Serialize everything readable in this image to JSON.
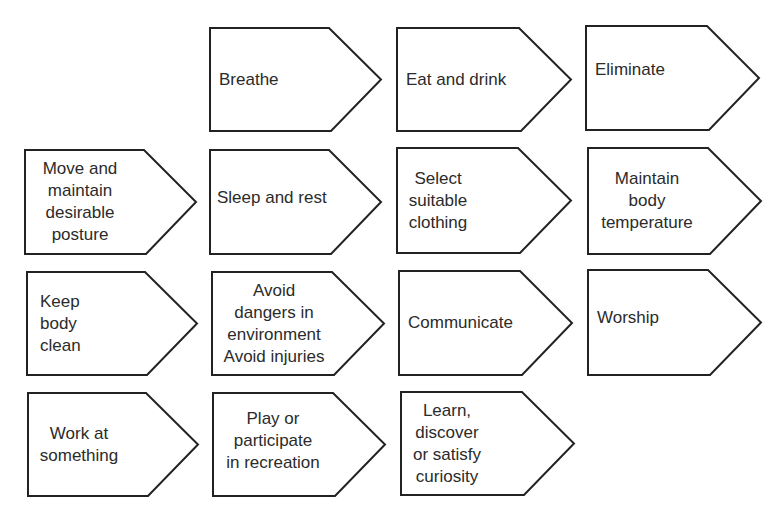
{
  "diagram": {
    "type": "pentagon-arrow-grid",
    "stroke_color": "#222222",
    "fill_color": "#ffffff",
    "nodes": [
      {
        "id": "breathe",
        "lines": [
          "Breathe"
        ],
        "row": 1,
        "col": 2,
        "x": 209,
        "y": 27,
        "w": 173,
        "h": 105,
        "align": "left",
        "label_left": 10,
        "label_width": 110
      },
      {
        "id": "eat-and-drink",
        "lines": [
          "Eat and drink"
        ],
        "row": 1,
        "col": 3,
        "x": 396,
        "y": 27,
        "w": 176,
        "h": 105,
        "align": "left",
        "label_left": 10,
        "label_width": 120
      },
      {
        "id": "eliminate",
        "lines": [
          "Eliminate"
        ],
        "row": 1,
        "col": 4,
        "x": 585,
        "y": 25,
        "w": 175,
        "h": 106,
        "align": "left",
        "label_left": 10,
        "label_width": 110,
        "label_offset_y": -8
      },
      {
        "id": "move-and-maintain-desirable-posture",
        "lines": [
          "Move and",
          "maintain",
          "desirable",
          "posture"
        ],
        "row": 2,
        "col": 1,
        "x": 24,
        "y": 149,
        "w": 173,
        "h": 106,
        "align": "center",
        "label_left": 6,
        "label_width": 100
      },
      {
        "id": "sleep-and-rest",
        "lines": [
          "Sleep and rest"
        ],
        "row": 2,
        "col": 2,
        "x": 209,
        "y": 149,
        "w": 173,
        "h": 106,
        "align": "left",
        "label_left": 8,
        "label_width": 130,
        "label_offset_y": -4
      },
      {
        "id": "select-suitable-clothing",
        "lines": [
          "Select",
          "suitable",
          "clothing"
        ],
        "row": 2,
        "col": 3,
        "x": 396,
        "y": 147,
        "w": 176,
        "h": 107,
        "align": "center",
        "label_left": 8,
        "label_width": 68
      },
      {
        "id": "maintain-body-temperature",
        "lines": [
          "Maintain",
          "body",
          "temperature"
        ],
        "row": 2,
        "col": 4,
        "x": 587,
        "y": 147,
        "w": 175,
        "h": 108,
        "align": "center",
        "label_left": 10,
        "label_width": 100
      },
      {
        "id": "keep-body-clean",
        "lines": [
          "Keep",
          "body",
          "clean"
        ],
        "row": 3,
        "col": 1,
        "x": 26,
        "y": 271,
        "w": 172,
        "h": 105,
        "align": "left",
        "label_left": 14,
        "label_width": 60
      },
      {
        "id": "avoid-dangers-avoid-injuries",
        "lines": [
          "Avoid",
          "dangers in",
          "environment",
          "Avoid injuries"
        ],
        "row": 3,
        "col": 2,
        "x": 211,
        "y": 271,
        "w": 174,
        "h": 105,
        "align": "center",
        "label_left": 4,
        "label_width": 118
      },
      {
        "id": "communicate",
        "lines": [
          "Communicate"
        ],
        "row": 3,
        "col": 3,
        "x": 398,
        "y": 270,
        "w": 175,
        "h": 106,
        "align": "left",
        "label_left": 10,
        "label_width": 120
      },
      {
        "id": "worship",
        "lines": [
          "Worship"
        ],
        "row": 3,
        "col": 4,
        "x": 587,
        "y": 269,
        "w": 175,
        "h": 107,
        "align": "left",
        "label_left": 10,
        "label_width": 100,
        "label_offset_y": -5
      },
      {
        "id": "work-at-something",
        "lines": [
          "Work at",
          "something"
        ],
        "row": 4,
        "col": 1,
        "x": 27,
        "y": 392,
        "w": 172,
        "h": 105,
        "align": "center",
        "label_left": 8,
        "label_width": 88
      },
      {
        "id": "play-or-participate-in-recreation",
        "lines": [
          "Play or",
          "participate",
          "in recreation"
        ],
        "row": 4,
        "col": 2,
        "x": 212,
        "y": 392,
        "w": 174,
        "h": 105,
        "align": "center",
        "label_left": 8,
        "label_width": 106,
        "label_offset_y": -4
      },
      {
        "id": "learn-discover-satisfy-curiosity",
        "lines": [
          "Learn,",
          "discover",
          "or satisfy",
          "curiosity"
        ],
        "row": 4,
        "col": 3,
        "x": 400,
        "y": 391,
        "w": 175,
        "h": 105,
        "align": "center",
        "label_left": 6,
        "label_width": 82
      }
    ]
  }
}
